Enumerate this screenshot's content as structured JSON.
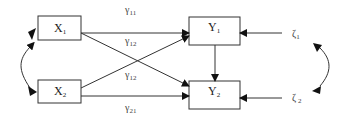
{
  "diagram": {
    "type": "path-diagram",
    "nodes": [
      {
        "id": "X1",
        "label": "X",
        "sub": "1"
      },
      {
        "id": "X2",
        "label": "X",
        "sub": "2"
      },
      {
        "id": "Y1",
        "label": "Y",
        "sub": "1"
      },
      {
        "id": "Y2",
        "label": "Y",
        "sub": "2"
      }
    ],
    "errors": [
      {
        "id": "zeta1",
        "label": "ζ",
        "sub": "1"
      },
      {
        "id": "zeta2",
        "label": "ζ",
        "sub": " 2"
      }
    ],
    "paths": [
      {
        "from": "X1",
        "to": "Y1",
        "label": "γ",
        "sub": "11"
      },
      {
        "from": "X1",
        "to": "Y2",
        "label": "γ",
        "sub": "12",
        "label_note": "upper"
      },
      {
        "from": "X2",
        "to": "Y1",
        "label": "γ",
        "sub": "12",
        "label_note": "lower"
      },
      {
        "from": "X2",
        "to": "Y2",
        "label": "γ",
        "sub": "21"
      },
      {
        "from": "Y1",
        "to": "Y2"
      },
      {
        "from": "zeta1",
        "to": "Y1"
      },
      {
        "from": "zeta2",
        "to": "Y2"
      }
    ],
    "covariances": [
      {
        "between": [
          "X1",
          "X2"
        ]
      },
      {
        "between": [
          "zeta1",
          "zeta2"
        ]
      }
    ]
  }
}
